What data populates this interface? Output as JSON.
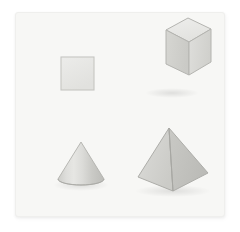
{
  "scene": {
    "title": "Geometric shapes illustration",
    "background_color": "#ffffff",
    "card_color": "#f7f7f5",
    "card_border_color": "#efefed",
    "outline_color": "#b9b9b6",
    "card": {
      "x": 15,
      "y": 12,
      "width": 208,
      "height": 203
    },
    "shape_count": "4"
  },
  "shapes": [
    {
      "name": "square",
      "label": "Square",
      "kind": "2d",
      "fill": "#e6e6e3",
      "stroke": "#c6c6c2",
      "position": "top-left",
      "bounds": {
        "x": 60,
        "y": 56,
        "width": 33,
        "height": 33
      }
    },
    {
      "name": "cube",
      "label": "Cube",
      "kind": "3d",
      "top_face_fill": "#e9e9e6",
      "left_face_fill": "#cfcfcb",
      "right_face_fill": "#d9d9d6",
      "stroke": "#b4b4b0",
      "position": "top-right",
      "bounds": {
        "x": 150,
        "y": 46,
        "width": 45,
        "height": 45
      }
    },
    {
      "name": "cone",
      "label": "Cone",
      "kind": "3d",
      "highlight_fill": "#e2e2df",
      "shadow_fill": "#c4c4c0",
      "stroke": "#b1b1ad",
      "position": "bottom-left",
      "bounds": {
        "x": 57,
        "y": 141,
        "width": 46,
        "height": 42
      }
    },
    {
      "name": "pyramid",
      "label": "Pyramid",
      "kind": "3d",
      "left_face_fill": "#d2d2ce",
      "right_face_fill": "#c3c3bf",
      "stroke": "#adada9",
      "position": "bottom-right",
      "bounds": {
        "x": 137,
        "y": 127,
        "width": 70,
        "height": 66
      }
    }
  ]
}
